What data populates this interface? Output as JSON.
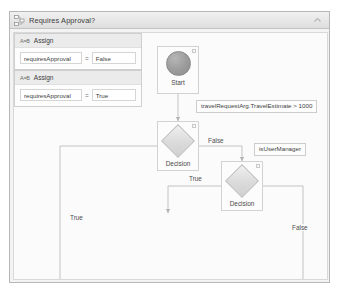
{
  "window": {
    "title": "Requires Approval?",
    "title_icon": "flowchart-icon",
    "collapse_icon": "chevron-up-icon"
  },
  "diagram": {
    "type": "flowchart",
    "start": {
      "label": "Start",
      "icon": "start-circle-icon"
    },
    "nodes": [
      {
        "id": "decision-1",
        "kind": "FlowDecision",
        "label": "Decision",
        "condition": "travelRequestArg.TravelEstimate > 1000"
      },
      {
        "id": "decision-2",
        "kind": "FlowDecision",
        "label": "Decision",
        "condition": "isUserManager"
      },
      {
        "id": "assign-false",
        "kind": "Assign",
        "title": "Assign",
        "glyph": "A=B",
        "lhs": "requiresApproval",
        "operator": "=",
        "rhs": "False"
      },
      {
        "id": "assign-true",
        "kind": "Assign",
        "title": "Assign",
        "glyph": "A=B",
        "lhs": "requiresApproval",
        "operator": "=",
        "rhs": "True"
      }
    ],
    "edge_labels": {
      "decision1_false": "False",
      "decision2_true": "True",
      "decision1_true": "True",
      "decision2_false": "False"
    },
    "colors": {
      "canvas_bg": "#fbfbfb",
      "node_border": "#d2d2d2",
      "connector": "#b9b9b9",
      "header_bg": "#ebebeb",
      "start_fill": "#9b9b9b"
    }
  }
}
